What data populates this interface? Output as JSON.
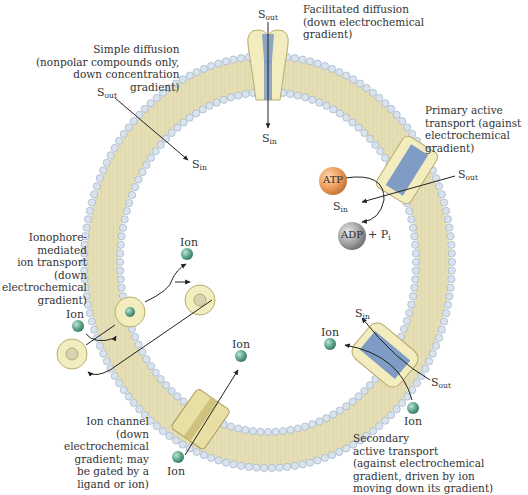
{
  "diagram": {
    "type": "membrane-transport-overview",
    "colors": {
      "membrane_tails": "#e6dfb6",
      "head_groups": "#d9e3ee",
      "head_outline": "#9fb2c6",
      "protein": "#f3ecbe",
      "protein_outline": "#b8ab6e",
      "channel_blue": "#7f9cc4",
      "ion": "#5fa88c",
      "atp": "#f0a060",
      "adp": "#a8a8a8",
      "arrow": "#222222"
    },
    "labels": {
      "simple_diffusion": "Simple diffusion\n(nonpolar compounds only,\ndown concentration\ngradient)",
      "facilitated_diffusion": "Facilitated diffusion\n(down electrochemical\ngradient)",
      "primary_active": "Primary active\ntransport (against\nelectrochemical\ngradient)",
      "ionophore": "Ionophore-\nmediated\nion transport\n(down\nelectrochemical\ngradient)",
      "ion_channel": "Ion channel\n(down\nelectrochemical\ngradient; may\nbe gated by a\nligand or ion)",
      "secondary_active": "Secondary\nactive transport\n(against electrochemical\ngradient, driven by ion\nmoving down its gradient)"
    },
    "symbols": {
      "s": "S",
      "out": "out",
      "in": "in",
      "ion": "Ion",
      "atp": "ATP",
      "adp": "ADP",
      "plus_pi": "+ P",
      "pi_sub": "i"
    }
  }
}
